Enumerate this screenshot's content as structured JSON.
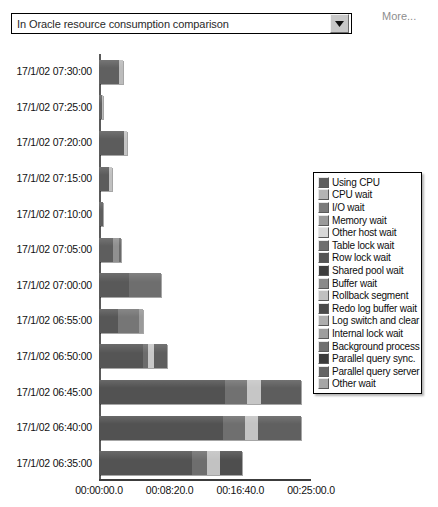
{
  "toolbar": {
    "series_selector_value": "In Oracle resource consumption comparison",
    "series_selector_placeholder": "Select comparison",
    "caret_icon": "chevron-down-icon",
    "more_label": "More..."
  },
  "chart_data": {
    "type": "bar",
    "orientation": "horizontal",
    "stacked": true,
    "title": "",
    "subtitle": "",
    "xlabel": "",
    "ylabel": "",
    "grid": false,
    "legend_position": "right",
    "xlim": [
      0,
      1500
    ],
    "x_unit": "seconds",
    "x_tick_labels": [
      "00:00:00.0",
      "00:08:20.0",
      "00:16:40.0",
      "00:25:00.0"
    ],
    "x_tick_values": [
      0,
      500,
      1000,
      1500
    ],
    "categories": [
      "17/1/02 07:30:00",
      "17/1/02 07:25:00",
      "17/1/02 07:20:00",
      "17/1/02 07:15:00",
      "17/1/02 07:10:00",
      "17/1/02 07:05:00",
      "17/1/02 07:00:00",
      "17/1/02 06:55:00",
      "17/1/02 06:50:00",
      "17/1/02 06:45:00",
      "17/1/02 06:40:00",
      "17/1/02 06:35:00"
    ],
    "series": [
      {
        "name": "Using CPU",
        "color": "#5e5e5e",
        "values": [
          170,
          30,
          190,
          90,
          25,
          150,
          430,
          300,
          460,
          1010,
          1000,
          700
        ]
      },
      {
        "name": "CPU wait",
        "color": "#b4b4b4",
        "values": [
          0,
          0,
          0,
          0,
          0,
          0,
          0,
          0,
          0,
          0,
          0,
          0
        ]
      },
      {
        "name": "I/O wait",
        "color": "#7a7a7a",
        "values": [
          0,
          0,
          0,
          0,
          0,
          0,
          0,
          0,
          0,
          0,
          0,
          0
        ]
      },
      {
        "name": "Memory wait",
        "color": "#9a9a9a",
        "values": [
          0,
          0,
          0,
          0,
          0,
          0,
          0,
          0,
          0,
          0,
          0,
          0
        ]
      },
      {
        "name": "Other host wait",
        "color": "#d2d2d2",
        "values": [
          0,
          0,
          0,
          0,
          0,
          0,
          0,
          0,
          0,
          0,
          0,
          0
        ]
      },
      {
        "name": "Table lock wait",
        "color": "#6e6e6e",
        "values": [
          0,
          0,
          0,
          0,
          0,
          0,
          0,
          0,
          0,
          0,
          0,
          0
        ]
      },
      {
        "name": "Row lock wait",
        "color": "#545454",
        "values": [
          0,
          0,
          0,
          0,
          0,
          0,
          0,
          0,
          0,
          0,
          0,
          0
        ]
      },
      {
        "name": "Shared pool wait",
        "color": "#3e3e3e",
        "values": [
          0,
          0,
          0,
          0,
          0,
          0,
          0,
          0,
          0,
          0,
          0,
          0
        ]
      },
      {
        "name": "Buffer wait",
        "color": "#8a8a8a",
        "values": [
          0,
          0,
          0,
          0,
          0,
          0,
          0,
          0,
          0,
          0,
          0,
          0
        ]
      },
      {
        "name": "Rollback segment",
        "color": "#c0c0c0",
        "values": [
          0,
          0,
          0,
          0,
          0,
          0,
          0,
          0,
          0,
          0,
          0,
          0
        ]
      },
      {
        "name": "Redo log buffer wait",
        "color": "#4a4a4a",
        "values": [
          0,
          0,
          0,
          0,
          0,
          0,
          0,
          0,
          0,
          0,
          0,
          0
        ]
      },
      {
        "name": "Log switch and clear",
        "color": "#aeaeae",
        "values": [
          0,
          0,
          0,
          0,
          0,
          0,
          0,
          0,
          0,
          0,
          0,
          0
        ]
      },
      {
        "name": "Internal lock wait",
        "color": "#9e9e9e",
        "values": [
          0,
          0,
          0,
          0,
          0,
          0,
          0,
          0,
          0,
          0,
          0,
          0
        ]
      },
      {
        "name": "Background process",
        "color": "#707070",
        "values": [
          0,
          0,
          0,
          0,
          0,
          0,
          0,
          0,
          0,
          0,
          0,
          0
        ]
      },
      {
        "name": "Parallel query sync.",
        "color": "#3a3a3a",
        "values": [
          0,
          0,
          0,
          0,
          0,
          0,
          0,
          0,
          0,
          0,
          0,
          0
        ]
      },
      {
        "name": "Parallel query server",
        "color": "#646464",
        "values": [
          0,
          0,
          0,
          0,
          0,
          0,
          0,
          0,
          0,
          0,
          0,
          0
        ]
      },
      {
        "name": "Other wait",
        "color": "#a6a6a6",
        "values": [
          0,
          0,
          0,
          0,
          0,
          0,
          0,
          0,
          0,
          0,
          0,
          0
        ]
      }
    ],
    "bars": [
      {
        "category": "17/1/02 07:30:00",
        "total": 170,
        "segments": [
          {
            "series": "Using CPU",
            "value": 145,
            "color": "#606060"
          },
          {
            "series": "Other wait",
            "value": 25,
            "color": "#bcbcbc"
          }
        ]
      },
      {
        "category": "17/1/02 07:25:00",
        "total": 30,
        "segments": [
          {
            "series": "Using CPU",
            "value": 20,
            "color": "#606060"
          },
          {
            "series": "Other wait",
            "value": 10,
            "color": "#bcbcbc"
          }
        ]
      },
      {
        "category": "17/1/02 07:20:00",
        "total": 200,
        "segments": [
          {
            "series": "Using CPU",
            "value": 175,
            "color": "#5c5c5c"
          },
          {
            "series": "Other wait",
            "value": 25,
            "color": "#c4c4c4"
          }
        ]
      },
      {
        "category": "17/1/02 07:15:00",
        "total": 95,
        "segments": [
          {
            "series": "Using CPU",
            "value": 70,
            "color": "#5c5c5c"
          },
          {
            "series": "Other wait",
            "value": 25,
            "color": "#c0c0c0"
          }
        ]
      },
      {
        "category": "17/1/02 07:10:00",
        "total": 25,
        "segments": [
          {
            "series": "Using CPU",
            "value": 25,
            "color": "#5e5e5e"
          }
        ]
      },
      {
        "category": "17/1/02 07:05:00",
        "total": 155,
        "segments": [
          {
            "series": "Using CPU",
            "value": 100,
            "color": "#5e5e5e"
          },
          {
            "series": "Buffer wait",
            "value": 40,
            "color": "#909090"
          },
          {
            "series": "Other wait",
            "value": 15,
            "color": "#6a6a6a"
          }
        ]
      },
      {
        "category": "17/1/02 07:00:00",
        "total": 440,
        "segments": [
          {
            "series": "Using CPU",
            "value": 215,
            "color": "#595959"
          },
          {
            "series": "Other wait",
            "value": 225,
            "color": "#6e6e6e"
          }
        ]
      },
      {
        "category": "17/1/02 06:55:00",
        "total": 310,
        "segments": [
          {
            "series": "Using CPU",
            "value": 135,
            "color": "#575757"
          },
          {
            "series": "Buffer wait",
            "value": 150,
            "color": "#767676"
          },
          {
            "series": "Other wait",
            "value": 25,
            "color": "#9a9a9a"
          }
        ]
      },
      {
        "category": "17/1/02 06:50:00",
        "total": 480,
        "segments": [
          {
            "series": "Using CPU",
            "value": 310,
            "color": "#555555"
          },
          {
            "series": "Buffer wait",
            "value": 35,
            "color": "#6c6c6c"
          },
          {
            "series": "Rollback segment",
            "value": 45,
            "color": "#c8c8c8"
          },
          {
            "series": "Other wait",
            "value": 90,
            "color": "#5e5e5e"
          }
        ]
      },
      {
        "category": "17/1/02 06:45:00",
        "total": 1430,
        "segments": [
          {
            "series": "Using CPU",
            "value": 890,
            "color": "#525252"
          },
          {
            "series": "Buffer wait",
            "value": 160,
            "color": "#717171"
          },
          {
            "series": "Rollback segment",
            "value": 95,
            "color": "#c6c6c6"
          },
          {
            "series": "Other wait",
            "value": 285,
            "color": "#5d5d5d"
          }
        ]
      },
      {
        "category": "17/1/02 06:40:00",
        "total": 1430,
        "segments": [
          {
            "series": "Using CPU",
            "value": 880,
            "color": "#525252"
          },
          {
            "series": "Buffer wait",
            "value": 155,
            "color": "#6f6f6f"
          },
          {
            "series": "Rollback segment",
            "value": 90,
            "color": "#c4c4c4"
          },
          {
            "series": "Other wait",
            "value": 305,
            "color": "#606060"
          }
        ]
      },
      {
        "category": "17/1/02 06:35:00",
        "total": 1010,
        "segments": [
          {
            "series": "Using CPU",
            "value": 660,
            "color": "#535353"
          },
          {
            "series": "Buffer wait",
            "value": 105,
            "color": "#6e6e6e"
          },
          {
            "series": "Rollback segment",
            "value": 90,
            "color": "#c2c2c2"
          },
          {
            "series": "Other wait",
            "value": 155,
            "color": "#4e4e4e"
          }
        ]
      }
    ]
  },
  "legend": {
    "items": [
      {
        "label": "Using CPU",
        "color": "#5e5e5e"
      },
      {
        "label": "CPU wait",
        "color": "#b4b4b4"
      },
      {
        "label": "I/O wait",
        "color": "#7a7a7a"
      },
      {
        "label": "Memory wait",
        "color": "#9a9a9a"
      },
      {
        "label": "Other host wait",
        "color": "#d8d8d8"
      },
      {
        "label": "Table lock wait",
        "color": "#6e6e6e"
      },
      {
        "label": "Row lock wait",
        "color": "#545454"
      },
      {
        "label": "Shared pool wait",
        "color": "#3e3e3e"
      },
      {
        "label": "Buffer wait",
        "color": "#8a8a8a"
      },
      {
        "label": "Rollback segment",
        "color": "#c0c0c0"
      },
      {
        "label": "Redo log buffer wait",
        "color": "#4a4a4a"
      },
      {
        "label": "Log switch and clear",
        "color": "#aeaeae"
      },
      {
        "label": "Internal lock wait",
        "color": "#9e9e9e"
      },
      {
        "label": "Background process",
        "color": "#707070"
      },
      {
        "label": "Parallel query sync.",
        "color": "#3a3a3a"
      },
      {
        "label": "Parallel query server",
        "color": "#646464"
      },
      {
        "label": "Other wait",
        "color": "#a6a6a6"
      }
    ]
  }
}
